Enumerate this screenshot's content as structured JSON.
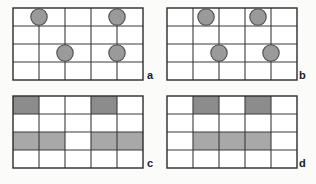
{
  "figure": {
    "caption_labels": [
      "a",
      "b",
      "c",
      "d"
    ],
    "grid": {
      "columns": 5,
      "rows": 4,
      "cell_width": 26,
      "cell_height": 18
    },
    "colors": {
      "background": "#fbfbfa",
      "grid_line": "#3a3a3a",
      "frame_line": "#2b2b2b",
      "circle_fill": "#9a9a9a",
      "circle_stroke": "#4a4a4a",
      "shade_dark": "#8c8c8c",
      "shade_light": "#a8a8a8",
      "cell_empty": "#ffffff",
      "label_text": "#1a1a1a"
    },
    "panels": [
      {
        "id": "panel-a",
        "label": "a",
        "label_x": 147,
        "label_y": 70,
        "origin_x": 13,
        "origin_y": 8,
        "type": "circles",
        "circles": [
          {
            "name": "circle-r1-c1",
            "cx": 1.0,
            "cy": 0.5,
            "r": 8.2
          },
          {
            "name": "circle-r1-c4",
            "cx": 4.0,
            "cy": 0.5,
            "r": 8.2
          },
          {
            "name": "circle-r3-c2",
            "cx": 2.0,
            "cy": 2.5,
            "r": 8.2
          },
          {
            "name": "circle-r3-c4",
            "cx": 4.0,
            "cy": 2.5,
            "r": 8.2
          }
        ]
      },
      {
        "id": "panel-b",
        "label": "b",
        "label_x": 299,
        "label_y": 70,
        "origin_x": 167,
        "origin_y": 8,
        "type": "circles",
        "circles": [
          {
            "name": "circle-r1-c2",
            "cx": 1.5,
            "cy": 0.5,
            "r": 8.2
          },
          {
            "name": "circle-r1-c4",
            "cx": 3.5,
            "cy": 0.5,
            "r": 8.2
          },
          {
            "name": "circle-r3-c2",
            "cx": 2.0,
            "cy": 2.5,
            "r": 8.2
          },
          {
            "name": "circle-r3-c4",
            "cx": 4.0,
            "cy": 2.5,
            "r": 8.2
          }
        ]
      },
      {
        "id": "panel-c",
        "label": "c",
        "label_x": 147,
        "label_y": 158,
        "origin_x": 13,
        "origin_y": 96,
        "type": "shaded",
        "shaded_cells": [
          {
            "name": "cell-r1-c1",
            "row": 0,
            "col": 0,
            "tone": "dark"
          },
          {
            "name": "cell-r1-c4",
            "row": 0,
            "col": 3,
            "tone": "dark"
          },
          {
            "name": "cell-r3-c1",
            "row": 2,
            "col": 0,
            "tone": "light"
          },
          {
            "name": "cell-r3-c2",
            "row": 2,
            "col": 1,
            "tone": "light"
          },
          {
            "name": "cell-r3-c4",
            "row": 2,
            "col": 3,
            "tone": "light"
          },
          {
            "name": "cell-r3-c5",
            "row": 2,
            "col": 4,
            "tone": "light"
          }
        ]
      },
      {
        "id": "panel-d",
        "label": "d",
        "label_x": 299,
        "label_y": 158,
        "origin_x": 167,
        "origin_y": 96,
        "type": "shaded",
        "shaded_cells": [
          {
            "name": "cell-r1-c2",
            "row": 0,
            "col": 1,
            "tone": "dark"
          },
          {
            "name": "cell-r1-c4",
            "row": 0,
            "col": 3,
            "tone": "dark"
          },
          {
            "name": "cell-r3-c2",
            "row": 2,
            "col": 1,
            "tone": "light"
          },
          {
            "name": "cell-r3-c3",
            "row": 2,
            "col": 2,
            "tone": "light"
          },
          {
            "name": "cell-r3-c4",
            "row": 2,
            "col": 3,
            "tone": "light"
          }
        ]
      }
    ]
  }
}
